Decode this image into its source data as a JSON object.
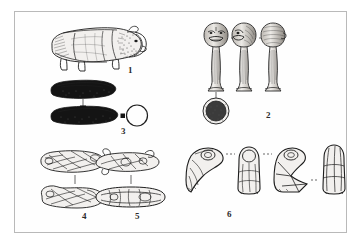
{
  "plate": {
    "type": "archaeological-figure-plate",
    "caption_style": "numbered line drawings",
    "border_color": "#b9b9b9",
    "background_color": "#ffffff",
    "ink_color": "#1d1d1d",
    "figures": [
      {
        "number": "1",
        "name": "zoomorphic-stone-figurine",
        "description": "Quadruped animal figurine shown in left lateral view, stippled hatching on head and hindquarters",
        "views": 1,
        "label_x": 113,
        "label_y": 59
      },
      {
        "number": "2",
        "name": "carved-head-pestles",
        "description": "Three pestles with anthropomorphic carved heads shown in three rotational views, plus a circular basal cross-section below",
        "views": 3,
        "label_x": 251,
        "label_y": 104
      },
      {
        "number": "3",
        "name": "elongated-blackened-implements",
        "description": "Two elongated dark implements in two views with a plain circular cross-section at right",
        "views": 2,
        "label_x": 106,
        "label_y": 120
      },
      {
        "number": "4",
        "name": "incised-stone-object-a",
        "description": "Small incised stone object shown in two stacked views joined by a vertical tie line",
        "views": 2,
        "label_x": 67,
        "label_y": 205
      },
      {
        "number": "5",
        "name": "incised-stone-object-b",
        "description": "Small incised stone object shown in two stacked views joined by a vertical tie line",
        "views": 2,
        "label_x": 120,
        "label_y": 205
      },
      {
        "number": "6",
        "name": "flaked-stone-tool-series",
        "description": "Four views of a flaked stone tool linked by dashed registration lines",
        "views": 4,
        "label_x": 212,
        "label_y": 203
      }
    ]
  }
}
